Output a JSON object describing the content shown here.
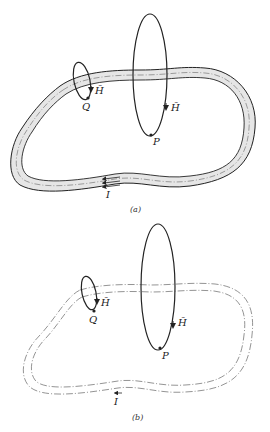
{
  "figure_a": {
    "caption": "(a)",
    "labels": {
      "point_q": "Q",
      "point_p": "P",
      "field_q": "H̄",
      "field_p": "H̄",
      "current": "I"
    },
    "description": "Thick conductor loop (shaded band) carrying current I; circular H-field loops around conductor at points Q and P"
  },
  "figure_b": {
    "caption": "(b)",
    "labels": {
      "point_q": "Q",
      "point_p": "P",
      "field_q": "H̄",
      "field_p": "H̄",
      "current": "I"
    },
    "description": "Thin filamentary loop (dash-dot outline) carrying current I; H-field loops at Q and P"
  },
  "colors": {
    "conductor_fill": "#e6e6e6",
    "stroke": "#222222",
    "dashdot": "#555555"
  }
}
